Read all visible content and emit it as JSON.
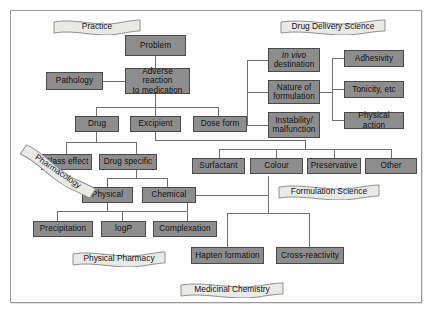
{
  "figure": {
    "type": "flowchart-diagram",
    "colors": {
      "node_fill": "#8d8d8d",
      "node_border": "#4a4a4a",
      "banner_fill": "#e9e9e6",
      "banner_border": "#8f8f8f",
      "connector": "#6f6f6f",
      "frame_border": "#9a9a9a",
      "background": "#fdfdfd"
    }
  },
  "banners": [
    {
      "id": "practice",
      "label": "Practice"
    },
    {
      "id": "drug-delivery-science",
      "label": "Drug Delivery Science"
    },
    {
      "id": "pharmacology",
      "label": "Pharmacology"
    },
    {
      "id": "formulation-science",
      "label": "Formulation Science"
    },
    {
      "id": "physical-pharmacy",
      "label": "Physical Pharmacy"
    },
    {
      "id": "medicinal-chemistry",
      "label": "Medicinal Chemistry"
    }
  ],
  "nodes": [
    {
      "id": "problem",
      "label": "Problem"
    },
    {
      "id": "pathology",
      "label": "Pathology"
    },
    {
      "id": "adverse-reaction",
      "line1": "Adverse reaction",
      "line2": "to medication"
    },
    {
      "id": "drug",
      "label": "Drug"
    },
    {
      "id": "excipient",
      "label": "Excipient"
    },
    {
      "id": "dose-form",
      "label": "Dose form"
    },
    {
      "id": "in-vivo-destination",
      "line1": "In vivo",
      "line2": "destination"
    },
    {
      "id": "nature-of-formulation",
      "line1": "Nature of",
      "line2": "formulation"
    },
    {
      "id": "instability-malfunction",
      "line1": "Instability/",
      "line2": "malfunction"
    },
    {
      "id": "adhesivity",
      "label": "Adhesivity"
    },
    {
      "id": "tonicity-etc",
      "label": "Tonicity, etc"
    },
    {
      "id": "physical-action",
      "label": "Physical action"
    },
    {
      "id": "class-effect",
      "label": "Class effect"
    },
    {
      "id": "drug-specific",
      "label": "Drug specific"
    },
    {
      "id": "surfactant",
      "label": "Surfactant"
    },
    {
      "id": "colour",
      "label": "Colour"
    },
    {
      "id": "preservative",
      "label": "Preservative"
    },
    {
      "id": "other",
      "label": "Other"
    },
    {
      "id": "physical",
      "label": "Physical"
    },
    {
      "id": "chemical",
      "label": "Chemical"
    },
    {
      "id": "precipitation",
      "label": "Precipitation"
    },
    {
      "id": "log-p",
      "label_prefix": "log ",
      "label_italic": "P"
    },
    {
      "id": "complexation",
      "label": "Complexation"
    },
    {
      "id": "hapten-formation",
      "label": "Hapten formation"
    },
    {
      "id": "cross-reactivity",
      "label": "Cross-reactivity"
    }
  ]
}
